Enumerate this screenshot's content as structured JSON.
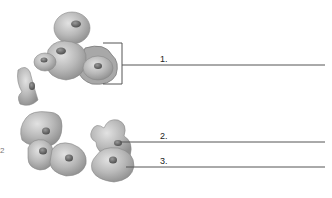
{
  "diagram": {
    "type": "labeled-illustration",
    "labels": [
      {
        "id": "1",
        "text": "1."
      },
      {
        "id": "2",
        "text": "2."
      },
      {
        "id": "3",
        "text": "3."
      }
    ],
    "left_partial_mark": "2"
  },
  "colors": {
    "cell_fill": "#b9b9b9",
    "cell_shadow": "#8a8a8a",
    "nucleus": "#5a5a5a",
    "line": "#555555"
  }
}
